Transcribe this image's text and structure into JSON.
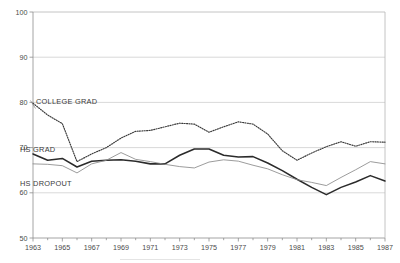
{
  "chart_data": {
    "type": "line",
    "title": "",
    "subtitle": "",
    "xlabel": "",
    "ylabel": "",
    "xlim": [
      1963,
      1987
    ],
    "ylim": [
      50,
      100
    ],
    "grid": true,
    "legend_position": "inline-annotations",
    "y_ticks": [
      "50",
      "60",
      "70",
      "80",
      "90",
      "100"
    ],
    "y_tick_values": [
      50,
      60,
      70,
      80,
      90,
      100
    ],
    "x_ticks": [
      "1963",
      "1965",
      "1967",
      "1969",
      "1971",
      "1973",
      "1975",
      "1977",
      "1979",
      "1981",
      "1983",
      "1985",
      "1987"
    ],
    "x_tick_values": [
      1963,
      1965,
      1967,
      1969,
      1971,
      1973,
      1975,
      1977,
      1979,
      1981,
      1983,
      1985,
      1987
    ],
    "x": [
      1963,
      1964,
      1965,
      1966,
      1967,
      1968,
      1969,
      1970,
      1971,
      1972,
      1973,
      1974,
      1975,
      1976,
      1977,
      1978,
      1979,
      1980,
      1981,
      1982,
      1983,
      1984,
      1985,
      1986,
      1987
    ],
    "series": [
      {
        "name": "COLLEGE GRAD",
        "style": "dotted",
        "color": "#3b3b3b",
        "values": [
          79.8,
          77.2,
          75.3,
          66.9,
          68.6,
          70.0,
          72.1,
          73.6,
          73.8,
          74.6,
          75.4,
          75.2,
          73.4,
          74.6,
          75.7,
          75.2,
          73.0,
          69.3,
          67.2,
          68.8,
          70.2,
          71.3,
          70.3,
          71.3,
          71.2
        ]
      },
      {
        "name": "HS GRAD",
        "style": "solid-thick",
        "color": "#2b2b2b",
        "values": [
          68.6,
          67.2,
          67.6,
          65.7,
          67.0,
          67.2,
          67.3,
          67.0,
          66.4,
          66.4,
          68.3,
          69.7,
          69.7,
          68.3,
          67.9,
          68.0,
          66.6,
          64.9,
          63.0,
          61.2,
          59.6,
          61.2,
          62.4,
          63.8,
          62.6
        ]
      },
      {
        "name": "HS DROPOUT",
        "style": "solid-thin",
        "color": "#8a8a8a",
        "values": [
          66.4,
          66.3,
          66.0,
          64.4,
          66.4,
          67.2,
          68.9,
          67.4,
          66.9,
          66.3,
          65.8,
          65.5,
          66.8,
          67.3,
          67.0,
          66.1,
          65.3,
          64.0,
          62.9,
          62.3,
          61.6,
          63.4,
          65.1,
          66.9,
          66.4
        ]
      }
    ],
    "annotations": [
      {
        "text": "COLLEGE GRAD",
        "x_px": 36,
        "y_px": 104
      },
      {
        "text": "HS GRAD",
        "x_px": 20,
        "y_px": 152
      },
      {
        "text": "HS DROPOUT",
        "x_px": 20,
        "y_px": 186
      }
    ]
  }
}
